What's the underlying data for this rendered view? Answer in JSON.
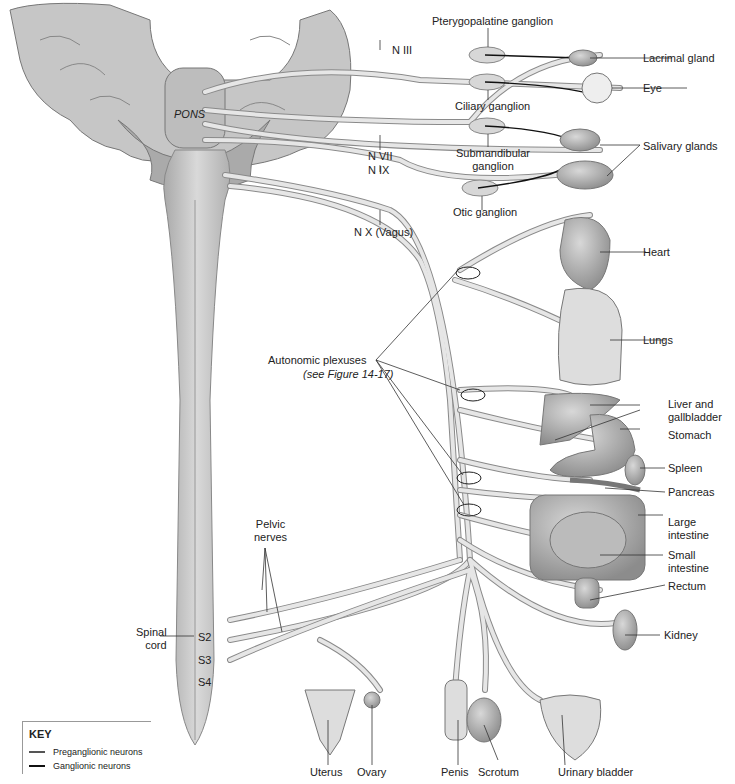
{
  "diagram": {
    "structures": {
      "pons": "PONS",
      "spinal_cord": "Spinal\ncord",
      "segments": [
        "S2",
        "S3",
        "S4"
      ]
    },
    "nerves": {
      "n3": "N III",
      "n7": "N VII",
      "n9": "N IX",
      "n10": "N X (Vagus)",
      "pelvic": "Pelvic\nnerves"
    },
    "ganglia": {
      "pterygopalatine": "Pterygopalatine ganglion",
      "ciliary": "Ciliary ganglion",
      "submandibular": "Submandibular\nganglion",
      "otic": "Otic ganglion"
    },
    "plexuses": {
      "label": "Autonomic plexuses",
      "ref": "(see Figure 14-17)"
    },
    "organs": {
      "lacrimal": "Lacrimal gland",
      "eye": "Eye",
      "salivary": "Salivary glands",
      "heart": "Heart",
      "lungs": "Lungs",
      "liver": "Liver and\ngallbladder",
      "stomach": "Stomach",
      "spleen": "Spleen",
      "pancreas": "Pancreas",
      "large_intestine": "Large\nintestine",
      "small_intestine": "Small\nintestine",
      "rectum": "Rectum",
      "kidney": "Kidney",
      "uterus": "Uterus",
      "ovary": "Ovary",
      "penis": "Penis",
      "scrotum": "Scrotum",
      "bladder": "Urinary bladder"
    },
    "key": {
      "title": "KEY",
      "items": [
        {
          "label": "Preganglionic neurons",
          "color": "#555555"
        },
        {
          "label": "Ganglionic neurons",
          "color": "#111111"
        }
      ]
    },
    "colors": {
      "nerve_fill": "#e4e4e4",
      "nerve_stroke": "#8a8a8a",
      "tissue": "#cfcfcf",
      "brain": "#bdbdbd"
    }
  }
}
